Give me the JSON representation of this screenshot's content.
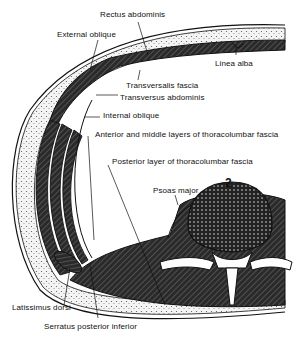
{
  "diagram": {
    "labels": {
      "rectus_abdominis": "Rectus abdominis",
      "external_oblique": "External oblique",
      "linea_alba": "Linea alba",
      "transversalis_fascia": "Transversalis fascia",
      "transversus_abdominis": "Transversus abdominis",
      "internal_oblique": "Internal oblique",
      "anterior_middle_layers": "Anterior and middle layers of thoracolumbar fascia",
      "posterior_layer": "Posterior layer of thoracolumbar fascia",
      "psoas_major": "Psoas major",
      "vertebra_number": "2",
      "latissimus_dorsi": "Latissimus dorsi",
      "serratus_posterior_inferior": "Serratus posterior inferior"
    },
    "colors": {
      "ink": "#111111",
      "muscle_fill": "#3a3a3a",
      "fat_fill": "#e8e8e8",
      "background": "#ffffff"
    }
  }
}
